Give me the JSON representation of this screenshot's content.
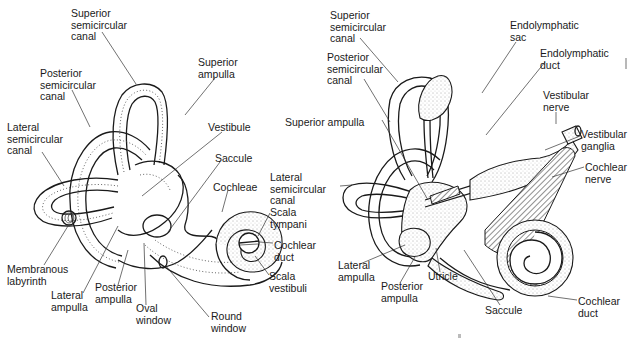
{
  "figure": {
    "title_fragment": "... vestibular sense.",
    "panels": [
      {
        "id": "left",
        "description": "Bony and membranous labyrinth of the inner ear",
        "labels": [
          {
            "text": "Superior\nsemicircular\ncanal",
            "x": 71,
            "y": 8
          },
          {
            "text": "Posterior\nsemicircular\ncanal",
            "x": 40,
            "y": 68
          },
          {
            "text": "Superior\nampulla",
            "x": 198,
            "y": 57
          },
          {
            "text": "Lateral\nsemicircular\ncanal",
            "x": 7,
            "y": 122
          },
          {
            "text": "Vestibule",
            "x": 208,
            "y": 122
          },
          {
            "text": "Saccule",
            "x": 215,
            "y": 153
          },
          {
            "text": "Cochleae",
            "x": 213,
            "y": 182
          },
          {
            "text": "Scala\ntympani",
            "x": 270,
            "y": 207
          },
          {
            "text": "Cochlear\nduct",
            "x": 274,
            "y": 240
          },
          {
            "text": "Scala\nvestibuli",
            "x": 269,
            "y": 271
          },
          {
            "text": "Membranous\nlabyrinth",
            "x": 7,
            "y": 264
          },
          {
            "text": "Lateral\nampulla",
            "x": 51,
            "y": 290
          },
          {
            "text": "Posterior\nampulla",
            "x": 95,
            "y": 282
          },
          {
            "text": "Oval\nwindow",
            "x": 136,
            "y": 303
          },
          {
            "text": "Round\nwindow",
            "x": 211,
            "y": 311
          }
        ]
      },
      {
        "id": "right",
        "description": "Membranous labyrinth with endolymphatic system and nerves",
        "labels": [
          {
            "text": "Superior\nsemicircular\ncanal",
            "x": 330,
            "y": 10
          },
          {
            "text": "Posterior\nsemicircular\ncanal",
            "x": 327,
            "y": 52
          },
          {
            "text": "Endolymphatic\nsac",
            "x": 510,
            "y": 20
          },
          {
            "text": "Endolymphatic\nduct",
            "x": 540,
            "y": 48
          },
          {
            "text": "Vestibular\nnerve",
            "x": 543,
            "y": 90
          },
          {
            "text": "Superior ampulla",
            "x": 285,
            "y": 117
          },
          {
            "text": "Vestibular\nganglia",
            "x": 581,
            "y": 129
          },
          {
            "text": "Lateral\nsemicircular\ncanal",
            "x": 270,
            "y": 172
          },
          {
            "text": "Cochlear\nnerve",
            "x": 585,
            "y": 162
          },
          {
            "text": "Lateral\nampulla",
            "x": 338,
            "y": 260
          },
          {
            "text": "Posterior\nampulla",
            "x": 381,
            "y": 281
          },
          {
            "text": "Utricle",
            "x": 428,
            "y": 271
          },
          {
            "text": "Saccule",
            "x": 485,
            "y": 305
          },
          {
            "text": "Cochlear\nduct",
            "x": 578,
            "y": 296
          }
        ]
      }
    ]
  },
  "colors": {
    "ink": "#1a1a1a",
    "background": "#ffffff"
  }
}
